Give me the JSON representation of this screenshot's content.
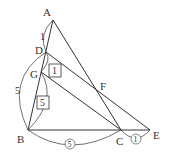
{
  "figure": {
    "type": "geometry-triangle-ratio-diagram",
    "points": {
      "A": {
        "label": "A",
        "x": 53,
        "y": 20
      },
      "D": {
        "label": "D",
        "x": 46,
        "y": 52
      },
      "G": {
        "label": "G",
        "x": 41,
        "y": 72
      },
      "B": {
        "label": "B",
        "x": 28,
        "y": 130
      },
      "C": {
        "label": "C",
        "x": 121,
        "y": 130
      },
      "E": {
        "label": "E",
        "x": 150,
        "y": 130
      },
      "F": {
        "label": "F",
        "x": 97,
        "y": 91
      }
    },
    "segments": [
      [
        "A",
        "B"
      ],
      [
        "A",
        "C"
      ],
      [
        "B",
        "E"
      ],
      [
        "D",
        "E"
      ],
      [
        "G",
        "C"
      ]
    ],
    "ratio_labels": {
      "AD": "1",
      "DB": "5",
      "DG_boxed": "1",
      "GB_boxed": "5",
      "BC_circled": "5",
      "CE_circled": "1"
    }
  }
}
